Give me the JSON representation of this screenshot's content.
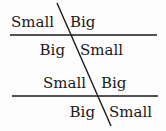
{
  "diagram": {
    "title": "",
    "lines": {
      "transversal": {
        "x1": 57,
        "y1": 3,
        "x2": 111,
        "y2": 126
      },
      "top_parallel": {
        "x1": 10,
        "y1": 35,
        "x2": 157,
        "y2": 35
      },
      "bottom_parallel": {
        "x1": 12,
        "y1": 96,
        "x2": 158,
        "y2": 96
      }
    },
    "top_intersection": {
      "above_left": "Small",
      "above_right": "Big",
      "below_left": "Big",
      "below_right": "Small"
    },
    "bottom_intersection": {
      "above_left": "Small",
      "above_right": "Big",
      "below_left": "Big",
      "below_right": "Small"
    },
    "colors": {
      "line": "#1a1a1a",
      "text": "#1a1a1a",
      "background": "#fdfdfd"
    }
  }
}
